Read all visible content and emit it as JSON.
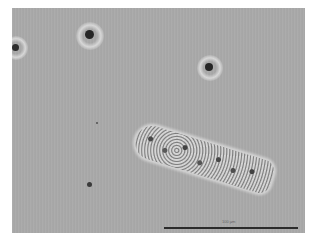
{
  "image": {
    "type": "phase-contrast micrograph",
    "background_color": "#a9a9a9",
    "page_background": "#ffffff"
  },
  "objects": [
    {
      "name": "particle-1",
      "x": 16,
      "y": 46,
      "size": 7
    },
    {
      "name": "particle-2",
      "x": 89,
      "y": 34,
      "size": 9
    },
    {
      "name": "particle-3",
      "x": 209,
      "y": 67,
      "size": 8
    },
    {
      "name": "particle-4",
      "x": 89,
      "y": 184,
      "size": 5
    },
    {
      "name": "particle-5",
      "x": 97,
      "y": 123,
      "size": 2
    },
    {
      "name": "elongated-cell",
      "x": 137,
      "y": 113,
      "length": 142
    }
  ],
  "scale_bar": {
    "label": "100 µm",
    "color": "#2b2b2b"
  }
}
